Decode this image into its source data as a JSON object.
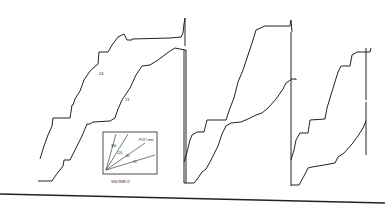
{
  "figure": {
    "panels": [
      {
        "id": "panel-1",
        "upper_trace_label": "24",
        "lower_trace_label": "21"
      },
      {
        "id": "panel-2",
        "upper_trace_label": "",
        "lower_trace_label": ""
      },
      {
        "id": "panel-3",
        "upper_trace_label": "",
        "lower_trace_label": ""
      }
    ],
    "inset": {
      "x_label": "10 MINUTES",
      "y_label": "O2 UPTAKE",
      "legend_title": "PO2 / mm",
      "lines": [
        "380",
        "120",
        "60",
        "15"
      ]
    }
  }
}
